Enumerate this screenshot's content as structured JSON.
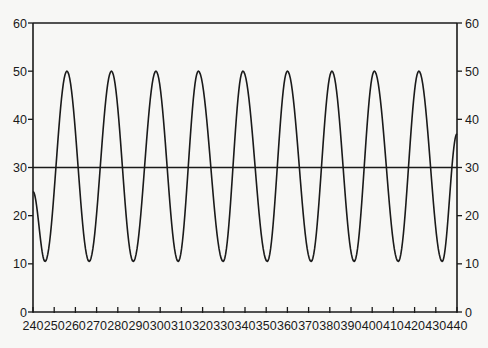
{
  "chart_data": {
    "type": "line",
    "title": "",
    "xlabel": "",
    "ylabel": "",
    "xlim": [
      240,
      440
    ],
    "ylim": [
      0,
      60
    ],
    "x_ticks": [
      240,
      250,
      260,
      270,
      280,
      290,
      300,
      310,
      320,
      330,
      340,
      350,
      360,
      370,
      380,
      390,
      400,
      410,
      420,
      430,
      440
    ],
    "y_ticks_left": [
      0,
      10,
      20,
      30,
      40,
      50,
      60
    ],
    "y_ticks_right": [
      0,
      10,
      20,
      30,
      40,
      50,
      60
    ],
    "grid": false,
    "legend": null,
    "reference_line": {
      "y": 30,
      "label": ""
    },
    "series": [
      {
        "name": "oscillation",
        "description": "periodic oscillation between ~10.5 and 50",
        "min": 10.5,
        "max": 50,
        "period": 20.8,
        "start_value": 25,
        "end_value": 37,
        "peaks_x": [
          256,
          277,
          298,
          318,
          339,
          360,
          381,
          401,
          422
        ],
        "troughs_x": [
          245.7,
          266.5,
          287.3,
          308.5,
          329.7,
          350.5,
          371.2,
          391.5,
          412.3,
          433
        ],
        "points": [
          {
            "x": 240,
            "y": 25
          },
          {
            "x": 245.7,
            "y": 10.5
          },
          {
            "x": 256,
            "y": 50
          },
          {
            "x": 266.5,
            "y": 10.5
          },
          {
            "x": 277,
            "y": 50
          },
          {
            "x": 287.3,
            "y": 10.5
          },
          {
            "x": 298,
            "y": 50
          },
          {
            "x": 308.5,
            "y": 10.5
          },
          {
            "x": 318,
            "y": 50
          },
          {
            "x": 329.7,
            "y": 10.5
          },
          {
            "x": 339,
            "y": 50
          },
          {
            "x": 350.5,
            "y": 10.5
          },
          {
            "x": 360,
            "y": 50
          },
          {
            "x": 371.2,
            "y": 10.5
          },
          {
            "x": 381,
            "y": 50
          },
          {
            "x": 391.5,
            "y": 10.5
          },
          {
            "x": 401,
            "y": 50
          },
          {
            "x": 412.3,
            "y": 10.5
          },
          {
            "x": 422,
            "y": 50
          },
          {
            "x": 433,
            "y": 10.5
          },
          {
            "x": 440,
            "y": 37
          }
        ]
      }
    ],
    "colors": {
      "line": "#1a1a1a",
      "axis": "#1a1a1a",
      "background": "#f7f7f5"
    }
  }
}
